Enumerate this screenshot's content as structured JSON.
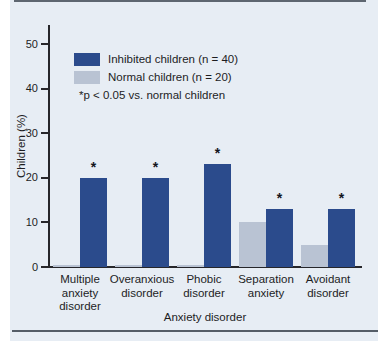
{
  "figure": {
    "kind": "scanned textbook bar chart panel"
  },
  "legend": {
    "items": [
      {
        "label": "Inhibited children (n = 40)",
        "color": "#2b4b8c"
      },
      {
        "label": "Normal children (n = 20)",
        "color": "#b9c3d3"
      }
    ],
    "note": "*p < 0.05 vs. normal children"
  },
  "chart_data": {
    "type": "bar",
    "title": "",
    "xlabel": "Anxiety disorder",
    "ylabel": "Children (%)",
    "ylim": [
      0,
      50
    ],
    "yticks": [
      0,
      10,
      20,
      30,
      40,
      50
    ],
    "grid": false,
    "legend_position": "upper-left-inside",
    "categories": [
      "Multiple anxiety disorder",
      "Overanxious disorder",
      "Phobic disorder",
      "Separation anxiety",
      "Avoidant disorder"
    ],
    "category_label_lines": [
      [
        "Multiple",
        "anxiety",
        "disorder"
      ],
      [
        "Overanxious",
        "disorder"
      ],
      [
        "Phobic",
        "disorder"
      ],
      [
        "Separation",
        "anxiety"
      ],
      [
        "Avoidant",
        "disorder"
      ]
    ],
    "series": [
      {
        "name": "Normal children (n = 20)",
        "color": "#b9c3d3",
        "values": [
          0.5,
          0.5,
          0.5,
          10,
          5
        ]
      },
      {
        "name": "Inhibited children (n = 40)",
        "color": "#2b4b8c",
        "values": [
          20,
          20,
          23,
          13,
          13
        ]
      }
    ],
    "significance_marker": "*",
    "significance_applies_to": "Inhibited children (n = 40)",
    "significant": [
      true,
      true,
      true,
      true,
      true
    ]
  },
  "colors": {
    "panel_background": "#e7edf4",
    "axis": "#26262a",
    "edge_lines": "#454d58",
    "bar_inhibited": "#2b4b8c",
    "bar_normal": "#b9c3d3"
  }
}
